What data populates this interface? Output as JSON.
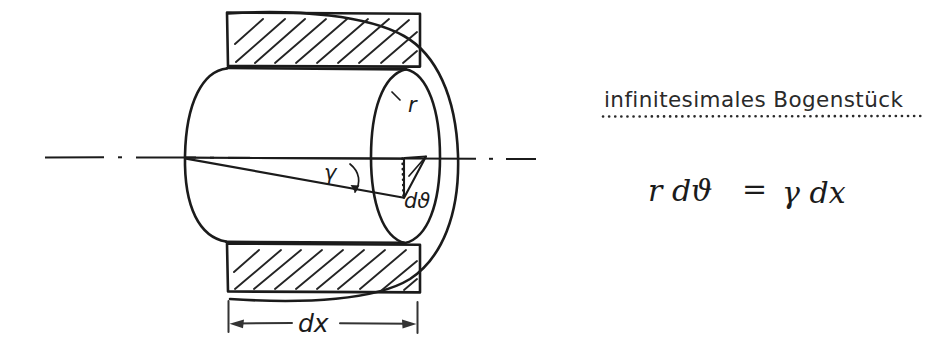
{
  "figure": {
    "kind": "hand-drawn-engineering-sketch",
    "ink_color": "#1b1b1b",
    "background_color": "#ffffff",
    "labels": {
      "radius": "r",
      "angle_increment": "dϑ",
      "shear_angle": "γ",
      "length_increment": "dx"
    }
  },
  "annotation": {
    "title": "infinitesimales Bogenstück",
    "formula": "r dϑ = γ dx",
    "formula_parts": {
      "lhs": "r dϑ",
      "equals": "=",
      "rhs": "γ dx"
    }
  },
  "dimension": {
    "label": "dx"
  }
}
